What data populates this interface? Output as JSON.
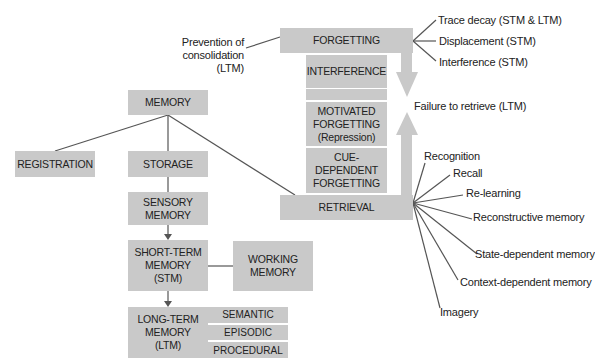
{
  "diagram": {
    "memory": "MEMORY",
    "registration": "REGISTRATION",
    "storage": "STORAGE",
    "sensory": "SENSORY MEMORY",
    "stm": "SHORT-TERM MEMORY (STM)",
    "working": "WORKING MEMORY",
    "ltm": "LONG-TERM MEMORY (LTM)",
    "ltm_types": [
      "SEMANTIC",
      "EPISODIC",
      "PROCEDURAL"
    ],
    "forgetting": "FORGETTING",
    "interference": "INTERFERENCE",
    "motivated": "MOTIVATED FORGETTING (Repression)",
    "cue_dependent": "CUE-DEPENDENT FORGETTING",
    "retrieval": "RETRIEVAL",
    "prevention": "Prevention of consolidation (LTM)",
    "forgetting_causes": [
      "Trace decay (STM & LTM)",
      "Displacement (STM)",
      "Interference (STM)"
    ],
    "failure": "Failure to retrieve (LTM)",
    "retrieval_types": [
      "Recognition",
      "Recall",
      "Re-learning",
      "Reconstructive memory",
      "State-dependent memory",
      "Context-dependent memory",
      "Imagery"
    ]
  },
  "colors": {
    "box": "#c9c9c9",
    "line": "#555555",
    "arrow": "#c9c9c9"
  }
}
